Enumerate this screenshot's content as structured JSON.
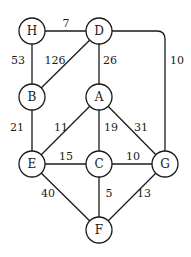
{
  "graph": {
    "nodes": [
      {
        "id": "H",
        "label": "H",
        "x": 32,
        "y": 31
      },
      {
        "id": "D",
        "label": "D",
        "x": 99,
        "y": 31
      },
      {
        "id": "B",
        "label": "B",
        "x": 32,
        "y": 97
      },
      {
        "id": "A",
        "label": "A",
        "x": 99,
        "y": 97
      },
      {
        "id": "E",
        "label": "E",
        "x": 32,
        "y": 164
      },
      {
        "id": "C",
        "label": "C",
        "x": 99,
        "y": 164
      },
      {
        "id": "G",
        "label": "G",
        "x": 165,
        "y": 164
      },
      {
        "id": "F",
        "label": "F",
        "x": 99,
        "y": 230
      }
    ],
    "edges": [
      {
        "from": "H",
        "to": "D",
        "weight": "7"
      },
      {
        "from": "H",
        "to": "B",
        "weight": "53"
      },
      {
        "from": "D",
        "to": "B",
        "weight": "126"
      },
      {
        "from": "D",
        "to": "A",
        "weight": "26"
      },
      {
        "from": "D",
        "to": "G",
        "weight": "10"
      },
      {
        "from": "B",
        "to": "E",
        "weight": "21"
      },
      {
        "from": "A",
        "to": "E",
        "weight": "11"
      },
      {
        "from": "A",
        "to": "C",
        "weight": "19"
      },
      {
        "from": "A",
        "to": "G",
        "weight": "31"
      },
      {
        "from": "E",
        "to": "C",
        "weight": "15"
      },
      {
        "from": "C",
        "to": "G",
        "weight": "10"
      },
      {
        "from": "E",
        "to": "F",
        "weight": "40"
      },
      {
        "from": "C",
        "to": "F",
        "weight": "5"
      },
      {
        "from": "G",
        "to": "F",
        "weight": "13"
      }
    ]
  },
  "labels": {
    "HD": "7",
    "HB": "53",
    "DB": "126",
    "DA": "26",
    "DG": "10",
    "BE": "21",
    "AE": "11",
    "AC": "19",
    "AG": "31",
    "EC": "15",
    "CG": "10",
    "EF": "40",
    "CF": "5",
    "GF": "13"
  },
  "nodes": {
    "H": "H",
    "D": "D",
    "B": "B",
    "A": "A",
    "E": "E",
    "C": "C",
    "G": "G",
    "F": "F"
  }
}
